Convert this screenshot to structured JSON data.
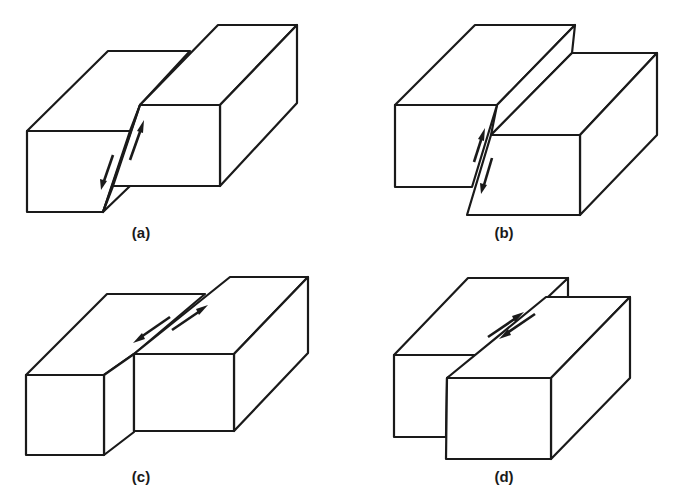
{
  "figure": {
    "line_color": "#1a1a1a",
    "background_color": "#ffffff",
    "panels": [
      {
        "id": "a",
        "label": "(a)",
        "fault_type": "reverse-fault",
        "motion": "dip-slip, hanging wall up"
      },
      {
        "id": "b",
        "label": "(b)",
        "fault_type": "normal-fault",
        "motion": "dip-slip, hanging wall down"
      },
      {
        "id": "c",
        "label": "(c)",
        "fault_type": "strike-slip-fault",
        "motion": "left-lateral strike-slip"
      },
      {
        "id": "d",
        "label": "(d)",
        "fault_type": "strike-slip-fault",
        "motion": "right-lateral strike-slip"
      }
    ]
  }
}
